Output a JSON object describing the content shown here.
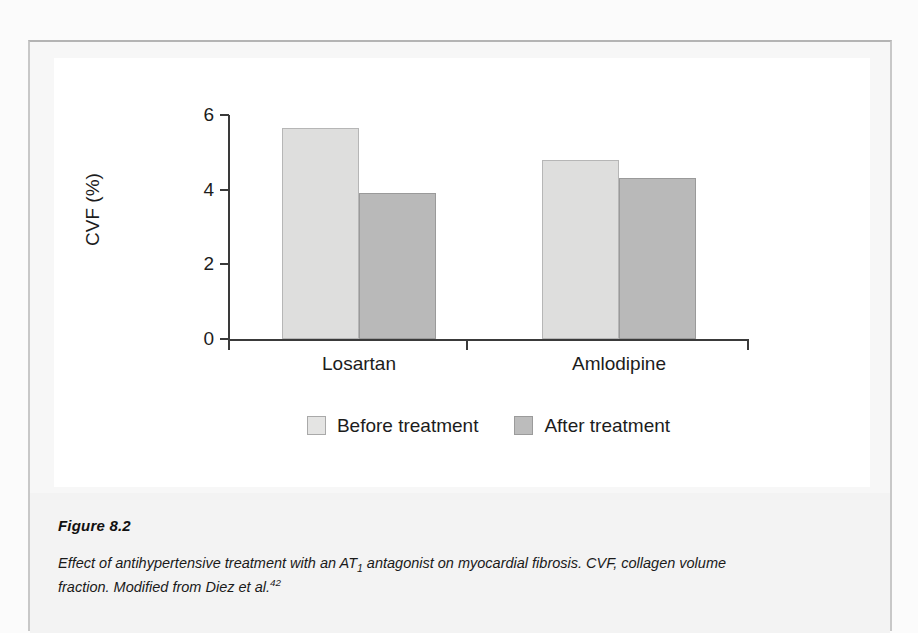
{
  "figure": {
    "number_label": "Figure 8.2",
    "caption_part1": "Effect of antihypertensive treatment with an AT",
    "caption_sub": "1",
    "caption_part2": " antagonist on myocardial fibrosis. CVF, collagen volume fraction. Modified from Diez et al.",
    "caption_sup": "42"
  },
  "chart_data": {
    "type": "bar",
    "title": "",
    "xlabel": "",
    "ylabel": "CVF (%)",
    "categories": [
      "Losartan",
      "Amlodipine"
    ],
    "series": [
      {
        "name": "Before treatment",
        "values": [
          5.65,
          4.8
        ],
        "color": "#dededd"
      },
      {
        "name": "After treatment",
        "values": [
          3.9,
          4.3
        ],
        "color": "#b9b9b9"
      }
    ],
    "ylim": [
      0,
      6
    ],
    "yticks": [
      0,
      2,
      4,
      6
    ],
    "ytick_labels": [
      "0",
      "2",
      "4",
      "6"
    ],
    "grid": false,
    "legend_position": "bottom"
  }
}
